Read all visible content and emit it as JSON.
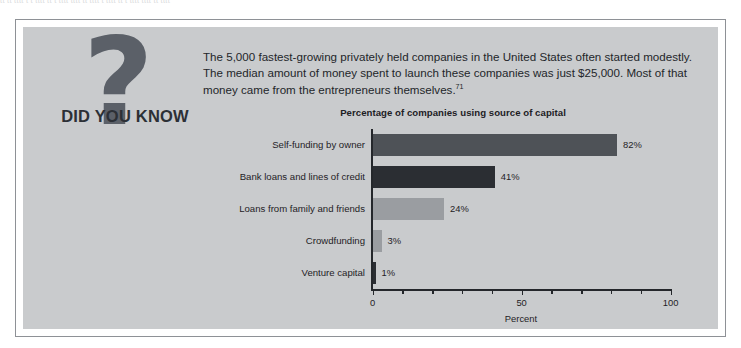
{
  "page": {
    "top_remnant": "tt  tt  tttt  t t  tttt  tt t  tttt     tttt  tt  tttt   t  tttt  tt  t tttt  tttt  tt tttt"
  },
  "callout": {
    "badge_label": "DID YOU KNOW",
    "question_mark_glyph": "?",
    "body_text": "The 5,000 fastest-growing privately held companies in the United States often started modestly. The median amount of money spent to launch these companies was just $25,000. Most of that money came from the entrepreneurs themselves.",
    "footnote_marker": "71"
  },
  "colors": {
    "panel_background": "#c9cbcd",
    "frame_border": "#8e9196",
    "question_mark": "#5b6068",
    "badge_text": "#2c3036",
    "axis": "#24272b",
    "bar_dark_gray": "#4e5257",
    "bar_near_black": "#2b2e33",
    "bar_light_gray": "#9a9da1"
  },
  "chart_data": {
    "type": "bar",
    "orientation": "horizontal",
    "title": "Percentage of companies using source of capital",
    "xlabel": "Percent",
    "ylabel": "",
    "xlim": [
      0,
      100
    ],
    "xticks": [
      0,
      10,
      20,
      30,
      40,
      50,
      60,
      70,
      80,
      90,
      100
    ],
    "xtick_labels": [
      "0",
      "",
      "",
      "",
      "",
      "50",
      "",
      "",
      "",
      "",
      "100"
    ],
    "grid": false,
    "legend": false,
    "categories": [
      "Self-funding by owner",
      "Bank loans and lines of credit",
      "Loans from family and friends",
      "Crowdfunding",
      "Venture capital"
    ],
    "values": [
      82,
      41,
      24,
      3,
      1
    ],
    "value_labels": [
      "82%",
      "41%",
      "24%",
      "3%",
      "1%"
    ],
    "bar_colors": [
      "#4e5257",
      "#2b2e33",
      "#9a9da1",
      "#9a9da1",
      "#2b2e33"
    ]
  }
}
